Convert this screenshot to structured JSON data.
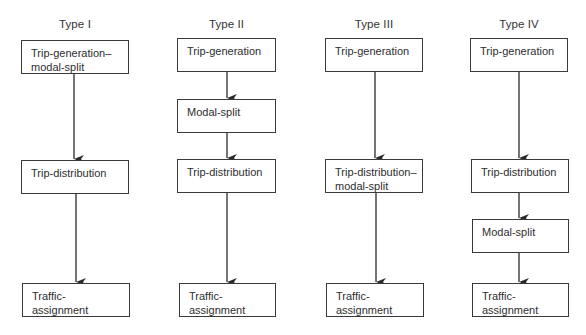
{
  "diagram": {
    "columns": [
      {
        "title": "Type I",
        "boxes": [
          {
            "label": "Trip-generation–\nmodal-split"
          },
          {
            "label": "Trip-distribution"
          },
          {
            "label": "Traffic-\nassignment"
          }
        ]
      },
      {
        "title": "Type II",
        "boxes": [
          {
            "label": "Trip-generation"
          },
          {
            "label": "Modal-split"
          },
          {
            "label": "Trip-distribution"
          },
          {
            "label": "Traffic-\nassignment"
          }
        ]
      },
      {
        "title": "Type III",
        "boxes": [
          {
            "label": "Trip-generation"
          },
          {
            "label": "Trip-distribution–\nmodal-split"
          },
          {
            "label": "Traffic-\nassignment"
          }
        ]
      },
      {
        "title": "Type IV",
        "boxes": [
          {
            "label": "Trip-generation"
          },
          {
            "label": "Trip-distribution"
          },
          {
            "label": "Modal-split"
          },
          {
            "label": "Traffic-\nassignment"
          }
        ]
      }
    ],
    "colors": {
      "line": "#2a2a2a",
      "box_border": "#3a3a3a",
      "text": "#2e2e2e"
    }
  }
}
